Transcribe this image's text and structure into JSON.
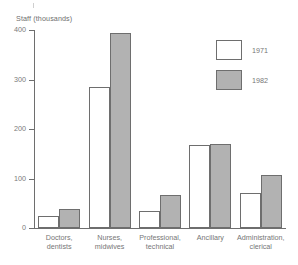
{
  "chart_data": {
    "type": "bar",
    "title": "",
    "subtitle": "",
    "xlabel": "",
    "ylabel": "Staff (thousands)",
    "ylim": [
      0,
      400
    ],
    "yticks": [
      0,
      100,
      200,
      300,
      400
    ],
    "ytick_labels": [
      "0",
      "100",
      "200",
      "300",
      "400"
    ],
    "grid": false,
    "legend_position": "top-right",
    "categories": [
      "Doctors,\ndentists",
      "Nurses,\nmidwives",
      "Professional,\ntechnical",
      "Ancillary",
      "Administration,\nclerical"
    ],
    "series": [
      {
        "name": "1971",
        "color": "#ffffff",
        "values": [
          25,
          285,
          35,
          167,
          70
        ]
      },
      {
        "name": "1982",
        "color": "#b2b2b2",
        "values": [
          38,
          393,
          67,
          170,
          108
        ]
      }
    ]
  },
  "legend": {
    "items": [
      {
        "label": "1971",
        "swatch": "#ffffff"
      },
      {
        "label": "1982",
        "swatch": "#b2b2b2"
      }
    ]
  }
}
